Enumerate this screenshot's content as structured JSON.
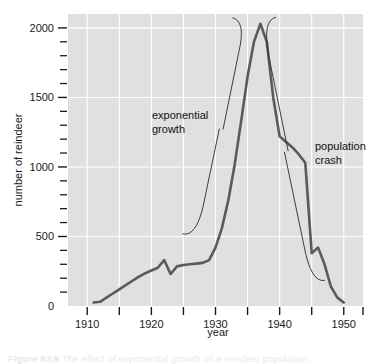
{
  "figure": {
    "caption_label": "Figure 53.9",
    "caption_text": "The effect of exponential growth on a reindeer population.",
    "background_color": "#ffffff",
    "plot_background_color": "#e0e0e0",
    "gridline_color": "#ffffff",
    "line_color": "#5a5a5a",
    "annotation_color": "#111111"
  },
  "chart_data": {
    "type": "line",
    "title": "",
    "xlabel": "year",
    "ylabel": "number of reindeer",
    "xlim": [
      1907,
      1953
    ],
    "ylim": [
      0,
      2100
    ],
    "grid": true,
    "legend": "none",
    "x_major_ticks": [
      1910,
      1915,
      1920,
      1925,
      1930,
      1935,
      1940,
      1945,
      1950
    ],
    "x_tick_labels": [
      "1910",
      "",
      "1920",
      "",
      "1930",
      "",
      "1940",
      "",
      "1950"
    ],
    "y_major_ticks": [
      0,
      500,
      1000,
      1500,
      2000
    ],
    "y_tick_labels": [
      "0",
      "500",
      "1000",
      "1500",
      "2000"
    ],
    "y_minor_tick_step": 100,
    "series": [
      {
        "name": "reindeer population",
        "x": [
          1911,
          1912,
          1913,
          1914,
          1915,
          1916,
          1917,
          1918,
          1919,
          1920,
          1921,
          1922,
          1923,
          1924,
          1925,
          1926,
          1927,
          1928,
          1929,
          1930,
          1931,
          1932,
          1933,
          1934,
          1935,
          1936,
          1937,
          1938,
          1939,
          1940,
          1941,
          1942,
          1943,
          1944,
          1945,
          1946,
          1947,
          1948,
          1949,
          1950
        ],
        "y": [
          25,
          30,
          60,
          90,
          120,
          150,
          180,
          210,
          235,
          255,
          275,
          330,
          230,
          285,
          295,
          300,
          305,
          310,
          330,
          420,
          560,
          760,
          1020,
          1330,
          1650,
          1900,
          2030,
          1900,
          1500,
          1220,
          1180,
          1140,
          1090,
          1030,
          380,
          420,
          300,
          140,
          60,
          25
        ]
      }
    ],
    "annotations": [
      {
        "name": "exponential-growth",
        "label_line1": "exponential",
        "label_line2": "growth",
        "brace_span_years": [
          1928,
          1937
        ],
        "brace_side": "right"
      },
      {
        "name": "population-crash",
        "label_line1": "population",
        "label_line2": "crash",
        "brace_span_years": [
          1938,
          1950
        ],
        "brace_side": "left"
      }
    ]
  }
}
